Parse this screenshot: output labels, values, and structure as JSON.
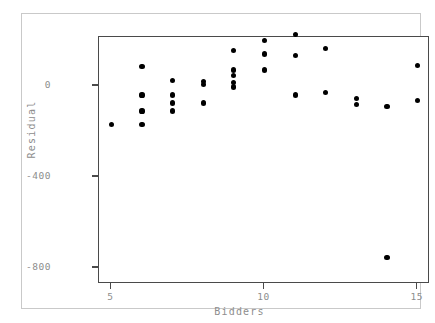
{
  "chart_data": {
    "type": "scatter",
    "title": "",
    "xlabel": "Bidders",
    "ylabel": "Residual",
    "xlim": [
      4.6,
      15.4
    ],
    "ylim": [
      -870,
      215
    ],
    "xticks": [
      5,
      10,
      15
    ],
    "xticklabels": [
      "5",
      "10",
      "15"
    ],
    "yticks": [
      0,
      -400,
      -800
    ],
    "yticklabels": [
      "0",
      "-400",
      "-800"
    ],
    "grid": false,
    "legend": null,
    "marker": "filled-circle",
    "marker_color": "#000000",
    "n_points": 33,
    "x": [
      5,
      6,
      6,
      6,
      6,
      7,
      7,
      7,
      7,
      8,
      8,
      8,
      9,
      9,
      9,
      9,
      9,
      10,
      10,
      10,
      11,
      11,
      11,
      12,
      12,
      13,
      13,
      14,
      15,
      15
    ],
    "y": [
      -170,
      85,
      -40,
      -110,
      -170,
      25,
      -40,
      -75,
      -110,
      20,
      5,
      -75,
      155,
      70,
      45,
      15,
      -5,
      200,
      140,
      70,
      225,
      135,
      -40,
      165,
      -30,
      -55,
      -80,
      -90,
      90,
      -65
    ],
    "points": [
      {
        "x": 5,
        "y": -170
      },
      {
        "x": 6,
        "y": 85
      },
      {
        "x": 6,
        "y": -40
      },
      {
        "x": 6,
        "y": -110
      },
      {
        "x": 6,
        "y": -170
      },
      {
        "x": 7,
        "y": 25
      },
      {
        "x": 7,
        "y": -40
      },
      {
        "x": 7,
        "y": -75
      },
      {
        "x": 7,
        "y": -110
      },
      {
        "x": 8,
        "y": 20
      },
      {
        "x": 8,
        "y": 5
      },
      {
        "x": 8,
        "y": -75
      },
      {
        "x": 9,
        "y": 155
      },
      {
        "x": 9,
        "y": 70
      },
      {
        "x": 9,
        "y": 45
      },
      {
        "x": 9,
        "y": 15
      },
      {
        "x": 9,
        "y": -5
      },
      {
        "x": 10,
        "y": 200
      },
      {
        "x": 10,
        "y": 140
      },
      {
        "x": 10,
        "y": 70
      },
      {
        "x": 11,
        "y": 225
      },
      {
        "x": 11,
        "y": 135
      },
      {
        "x": 11,
        "y": -40
      },
      {
        "x": 12,
        "y": 165
      },
      {
        "x": 12,
        "y": -30
      },
      {
        "x": 13,
        "y": -55
      },
      {
        "x": 13,
        "y": -80
      },
      {
        "x": 14,
        "y": -90
      },
      {
        "x": 14,
        "y": -755
      },
      {
        "x": 15,
        "y": 90
      },
      {
        "x": 15,
        "y": -65
      }
    ]
  },
  "colors": {
    "marker": "#000000",
    "axis": "#4a4a4a",
    "tick_label": "#8d8d8d",
    "outer_frame": "#c9c9c9",
    "background": "#ffffff"
  }
}
